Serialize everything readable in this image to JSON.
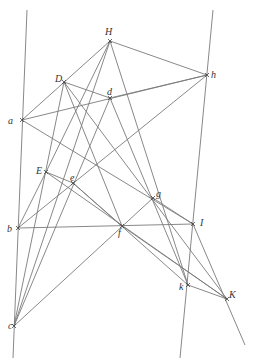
{
  "figure": {
    "type": "geometric-construction",
    "line_color": "#7a7a7a",
    "label_color": "#333333",
    "points": [
      {
        "id": "H",
        "label": "H",
        "x": 110,
        "y": 41,
        "lx": 105,
        "ly": 35
      },
      {
        "id": "h",
        "label": "h",
        "x": 207,
        "y": 75,
        "lx": 211,
        "ly": 78
      },
      {
        "id": "D",
        "label": "D",
        "x": 64,
        "y": 82,
        "lx": 55,
        "ly": 82
      },
      {
        "id": "d",
        "label": "d",
        "x": 110,
        "y": 98,
        "lx": 107,
        "ly": 95
      },
      {
        "id": "a",
        "label": "a",
        "x": 22,
        "y": 120,
        "lx": 8,
        "ly": 124
      },
      {
        "id": "E",
        "label": "E",
        "x": 46,
        "y": 172,
        "lx": 36,
        "ly": 174
      },
      {
        "id": "e",
        "label": "e",
        "x": 73,
        "y": 183,
        "lx": 70,
        "ly": 181
      },
      {
        "id": "g",
        "label": "g",
        "x": 153,
        "y": 198,
        "lx": 156,
        "ly": 197
      },
      {
        "id": "b",
        "label": "b",
        "x": 18,
        "y": 228,
        "lx": 7,
        "ly": 232
      },
      {
        "id": "I",
        "label": "I",
        "x": 193,
        "y": 224,
        "lx": 200,
        "ly": 226
      },
      {
        "id": "f",
        "label": "f",
        "x": 122,
        "y": 226,
        "lx": 118,
        "ly": 236
      },
      {
        "id": "k",
        "label": "k",
        "x": 188,
        "y": 285,
        "lx": 179,
        "ly": 290
      },
      {
        "id": "K",
        "label": "K",
        "x": 227,
        "y": 299,
        "lx": 229,
        "ly": 298
      },
      {
        "id": "c",
        "label": "c",
        "x": 14,
        "y": 326,
        "lx": 8,
        "ly": 329
      }
    ],
    "lines": [
      {
        "name": "left-vertical",
        "x1": 27,
        "y1": 10,
        "x2": 13,
        "y2": 358
      },
      {
        "name": "right-vertical",
        "x1": 213,
        "y1": 10,
        "x2": 180,
        "y2": 358
      },
      {
        "name": "H-a",
        "x1": 110,
        "y1": 41,
        "x2": 22,
        "y2": 120
      },
      {
        "name": "H-h",
        "x1": 110,
        "y1": 41,
        "x2": 207,
        "y2": 75
      },
      {
        "name": "H-c",
        "x1": 110,
        "y1": 41,
        "x2": 14,
        "y2": 326
      },
      {
        "name": "H-k",
        "x1": 110,
        "y1": 41,
        "x2": 188,
        "y2": 285
      },
      {
        "name": "H-E",
        "x1": 110,
        "y1": 41,
        "x2": 46,
        "y2": 172
      },
      {
        "name": "D-d",
        "x1": 64,
        "y1": 82,
        "x2": 110,
        "y2": 98
      },
      {
        "name": "d-h",
        "x1": 110,
        "y1": 98,
        "x2": 207,
        "y2": 75
      },
      {
        "name": "D-K",
        "x1": 64,
        "y1": 82,
        "x2": 227,
        "y2": 299
      },
      {
        "name": "D-c",
        "x1": 64,
        "y1": 82,
        "x2": 14,
        "y2": 326
      },
      {
        "name": "D-f",
        "x1": 64,
        "y1": 82,
        "x2": 122,
        "y2": 226
      },
      {
        "name": "a-h",
        "x1": 22,
        "y1": 120,
        "x2": 207,
        "y2": 75
      },
      {
        "name": "a-I",
        "x1": 22,
        "y1": 120,
        "x2": 193,
        "y2": 224
      },
      {
        "name": "d-c",
        "x1": 110,
        "y1": 98,
        "x2": 14,
        "y2": 326
      },
      {
        "name": "d-k",
        "x1": 110,
        "y1": 98,
        "x2": 188,
        "y2": 285
      },
      {
        "name": "b-h",
        "x1": 18,
        "y1": 228,
        "x2": 207,
        "y2": 75
      },
      {
        "name": "b-I",
        "x1": 18,
        "y1": 228,
        "x2": 193,
        "y2": 224
      },
      {
        "name": "b-E",
        "x1": 18,
        "y1": 228,
        "x2": 46,
        "y2": 172
      },
      {
        "name": "E-e",
        "x1": 46,
        "y1": 172,
        "x2": 73,
        "y2": 183
      },
      {
        "name": "E-K",
        "x1": 46,
        "y1": 172,
        "x2": 227,
        "y2": 299
      },
      {
        "name": "e-k",
        "x1": 73,
        "y1": 183,
        "x2": 188,
        "y2": 285
      },
      {
        "name": "e-f",
        "x1": 73,
        "y1": 183,
        "x2": 122,
        "y2": 226
      },
      {
        "name": "c-g",
        "x1": 14,
        "y1": 326,
        "x2": 153,
        "y2": 198
      },
      {
        "name": "g-I",
        "x1": 153,
        "y1": 198,
        "x2": 193,
        "y2": 224
      },
      {
        "name": "I-ext",
        "x1": 193,
        "y1": 224,
        "x2": 245,
        "y2": 345
      },
      {
        "name": "k-K",
        "x1": 188,
        "y1": 285,
        "x2": 227,
        "y2": 299
      },
      {
        "name": "f-K",
        "x1": 122,
        "y1": 226,
        "x2": 227,
        "y2": 299
      }
    ]
  }
}
